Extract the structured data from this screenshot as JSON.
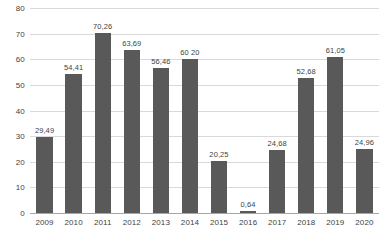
{
  "chart_data": {
    "type": "bar",
    "title": "",
    "subtitle": "",
    "xlabel": "",
    "ylabel": "",
    "categories": [
      "2009",
      "2010",
      "2011",
      "2012",
      "2013",
      "2014",
      "2015",
      "2016",
      "2017",
      "2018",
      "2019",
      "2020"
    ],
    "values": [
      29.49,
      54.41,
      70.26,
      63.69,
      56.46,
      60.2,
      20.25,
      0.64,
      24.68,
      52.68,
      61.05,
      24.96
    ],
    "value_labels": [
      "29,49",
      "54,41",
      "70,26",
      "63,69",
      "56,46",
      "60 20",
      "20,25",
      "0,64",
      "24,68",
      "52,68",
      "61,05",
      "24,96"
    ],
    "ylim": [
      0,
      80
    ],
    "y_ticks": [
      0,
      10,
      20,
      30,
      40,
      50,
      60,
      70,
      80
    ],
    "y_tick_labels": [
      "0",
      "10",
      "20",
      "30",
      "40",
      "50",
      "60",
      "70",
      "80"
    ],
    "grid": true,
    "grid_axis": "y",
    "legend": false,
    "legend_position": "none",
    "decimal_separator": ",",
    "colors": {
      "bar": "#595959",
      "gridline": "#d9d9d9",
      "axis": "#a6a6a6",
      "text": "#3f3f3f",
      "background": "#ffffff"
    }
  }
}
